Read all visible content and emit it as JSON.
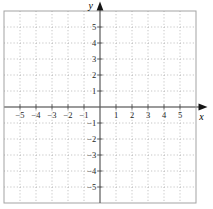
{
  "chart_data": {
    "type": "scatter",
    "title": "",
    "xlabel": "x",
    "ylabel": "y",
    "xlim": [
      -6,
      6
    ],
    "ylim": [
      -6,
      6
    ],
    "x_ticks": [
      -5,
      -4,
      -3,
      -2,
      -1,
      1,
      2,
      3,
      4,
      5
    ],
    "y_ticks": [
      -5,
      -4,
      -3,
      -2,
      -1,
      1,
      2,
      3,
      4,
      5
    ],
    "grid": true,
    "grid_step": 1,
    "legend": false,
    "series": [],
    "colors": {
      "background": "#ffffff",
      "grid": "#b8b8b8",
      "border": "#a3a3a3",
      "x_axis": "#9a9a9a",
      "y_axis": "#5a5a5a",
      "tick": "#4a4a4a",
      "arrow": "#151515",
      "label": "#1f1f1f"
    }
  }
}
